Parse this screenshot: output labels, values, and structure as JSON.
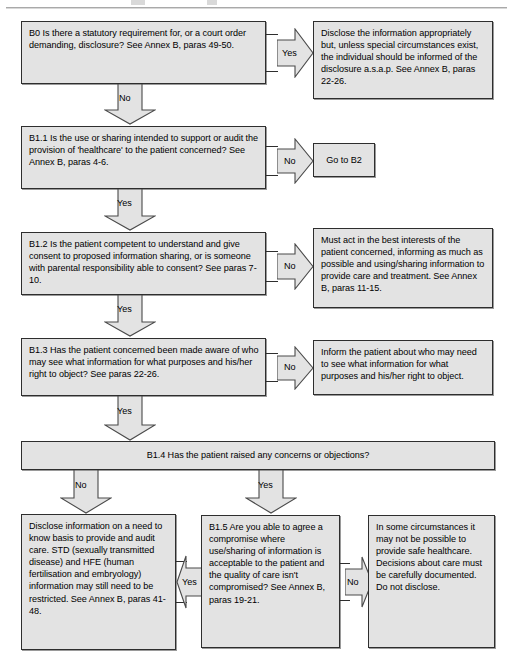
{
  "page": {
    "width": 513,
    "height": 667,
    "background": "#ffffff",
    "box_fill": "#e3e3e3",
    "box_border": "#2e2e2e",
    "arrow_fill": "#e3e3e3",
    "arrow_border": "#4a4a4a"
  },
  "nodes": {
    "b0": {
      "id": "B0",
      "text": "B0  Is there a statutory requirement for, or a court order demanding, disclosure? See Annex B, paras 49-50."
    },
    "b0_yes_outcome": {
      "text": "Disclose the information appropriately but, unless special circumstances exist, the individual should be informed of the disclosure a.s.a.p.  See Annex B, paras 22-26."
    },
    "b1_1": {
      "id": "B1.1",
      "text": "B1.1  Is the use or sharing intended to support or audit the provision of 'healthcare' to the patient concerned? See Annex B, paras 4-6."
    },
    "b1_1_no_outcome": {
      "text": "Go to B2"
    },
    "b1_2": {
      "id": "B1.2",
      "text": "B1.2  Is the patient competent to understand and give consent to proposed information sharing, or is someone with parental responsibility able to consent? See paras 7-10."
    },
    "b1_2_no_outcome": {
      "text": "Must act in the best interests of the patient concerned, informing as much as possible and using/sharing information to provide care and treatment. See Annex B, paras 11-15."
    },
    "b1_3": {
      "id": "B1.3",
      "text": "B1.3  Has the patient concerned been made aware of who may see what information for what purposes and his/her right to object? See paras 22-26."
    },
    "b1_3_no_outcome": {
      "text": "Inform the patient about who may need to see what information for what purposes and his/her right to object."
    },
    "b1_4": {
      "id": "B1.4",
      "text": "B1.4  Has the patient raised any concerns or objections?"
    },
    "b1_4_no_outcome": {
      "text": "Disclose information on a need to know basis to provide and audit care. STD (sexually transmitted disease) and HFE (human fertilisation and embryology) information may still need to be restricted. See Annex B, paras 41-48."
    },
    "b1_5": {
      "id": "B1.5",
      "text": "B1.5  Are you able to agree a compromise where use/sharing of information is acceptable to the patient and the quality of care isn't compromised? See Annex B, paras 19-21."
    },
    "b1_5_no_outcome": {
      "text": "In some circumstances it may not be possible to provide safe healthcare. Decisions about care must be carefully documented. Do not disclose."
    }
  },
  "edges": {
    "b0_yes": {
      "label": "Yes",
      "direction": "right"
    },
    "b0_no": {
      "label": "No",
      "direction": "down"
    },
    "b1_1_no": {
      "label": "No",
      "direction": "right"
    },
    "b1_1_yes": {
      "label": "Yes",
      "direction": "down"
    },
    "b1_2_no": {
      "label": "No",
      "direction": "right"
    },
    "b1_2_yes": {
      "label": "Yes",
      "direction": "down"
    },
    "b1_3_no": {
      "label": "No",
      "direction": "right"
    },
    "b1_3_yes": {
      "label": "Yes",
      "direction": "down"
    },
    "b1_4_no": {
      "label": "No",
      "direction": "down"
    },
    "b1_4_yes": {
      "label": "Yes",
      "direction": "down"
    },
    "b1_5_yes": {
      "label": "Yes",
      "direction": "left"
    },
    "b1_5_no": {
      "label": "No",
      "direction": "right"
    }
  }
}
